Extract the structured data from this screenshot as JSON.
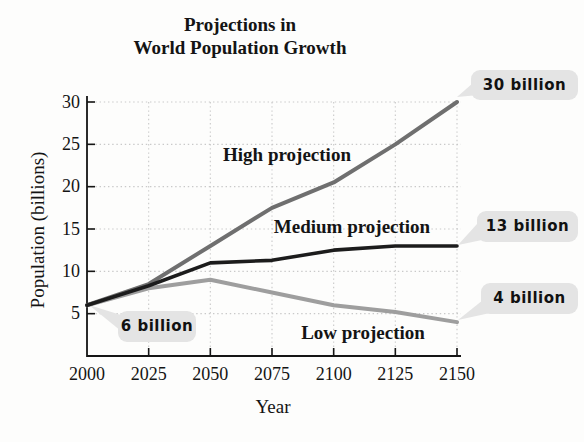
{
  "title": {
    "line1": "Projections in",
    "line2": "World Population Growth"
  },
  "chart_data": {
    "type": "line",
    "title": "Projections in World Population Growth",
    "xlabel": "Year",
    "ylabel": "Population (billions)",
    "x": [
      2000,
      2025,
      2050,
      2075,
      2100,
      2125,
      2150
    ],
    "x_tick_labels": [
      "2000",
      "2025",
      "2050",
      "2075",
      "2100",
      "2125",
      "2150"
    ],
    "y_ticks": [
      5,
      10,
      15,
      20,
      25,
      30
    ],
    "xlim": [
      2000,
      2150
    ],
    "ylim": [
      0,
      30
    ],
    "grid": true,
    "grid_style": "dotted",
    "legend_position": "inline-labels",
    "series": [
      {
        "name": "High projection",
        "values": [
          6,
          8.5,
          13,
          17.5,
          20.5,
          25,
          30
        ],
        "color": "#6f6f6f",
        "end_label": "30 billion"
      },
      {
        "name": "Medium projection",
        "values": [
          6,
          8.3,
          11,
          11.3,
          12.5,
          13,
          13
        ],
        "color": "#1c1c1c",
        "end_label": "13 billion"
      },
      {
        "name": "Low projection",
        "values": [
          6,
          8,
          9,
          7.5,
          6,
          5.2,
          4
        ],
        "color": "#9e9e9e",
        "end_label": "4 billion"
      }
    ],
    "start_label": "6 billion",
    "start_value_annotated": 6
  },
  "colors": {
    "axis": "#151515",
    "grid": "#c9c9c9",
    "callout_bg": "#e4e4e4",
    "text": "#141414",
    "background": "#fdfdfc"
  }
}
